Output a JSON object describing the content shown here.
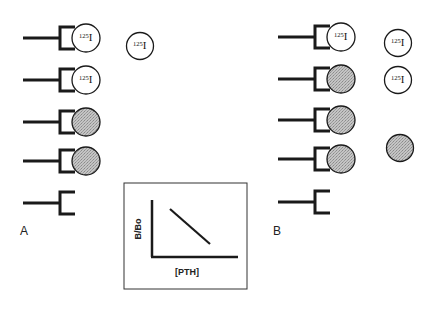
{
  "colors": {
    "line": "#1a1a1a",
    "shaded": "#b8b8b8",
    "background": "#ffffff"
  },
  "isotope": {
    "mass": "125",
    "symbol": "I"
  },
  "panels": [
    {
      "label": "A",
      "rows": [
        {
          "ligand": "labeled"
        },
        {
          "ligand": "labeled"
        },
        {
          "ligand": "unlabeled"
        },
        {
          "ligand": "unlabeled"
        },
        {
          "ligand": "none"
        }
      ],
      "free": [
        "labeled"
      ]
    },
    {
      "label": "B",
      "rows": [
        {
          "ligand": "labeled"
        },
        {
          "ligand": "unlabeled"
        },
        {
          "ligand": "unlabeled"
        },
        {
          "ligand": "unlabeled"
        },
        {
          "ligand": "none"
        }
      ],
      "free": [
        "labeled",
        "labeled",
        "unlabeled"
      ]
    }
  ],
  "inset_chart": {
    "ylabel": "B/Bo",
    "xlabel": "[PTH]",
    "trend": "decreasing"
  }
}
